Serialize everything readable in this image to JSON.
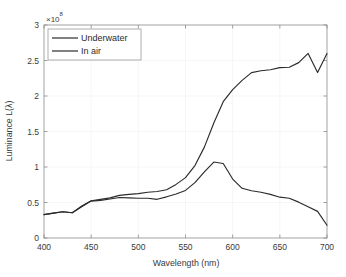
{
  "chart_data": {
    "type": "line",
    "title": "",
    "xlabel": "Wavelength (nm)",
    "ylabel": "Luminance L(λ)",
    "y_exponent_base": "×10",
    "y_exponent_power": "8",
    "y_exponent_label": "×10⁸",
    "xlim": [
      400,
      700
    ],
    "ylim": [
      0,
      3
    ],
    "xticks": [
      400,
      450,
      500,
      550,
      600,
      650,
      700
    ],
    "xtick_labels": [
      "400",
      "450",
      "500",
      "550",
      "600",
      "650",
      "700"
    ],
    "yticks": [
      0,
      0.5,
      1,
      1.5,
      2,
      2.5,
      3
    ],
    "ytick_labels": [
      "0",
      "0.5",
      "1",
      "1.5",
      "2",
      "2.5",
      "3"
    ],
    "grid": true,
    "legend_position": "upper left",
    "x": [
      400,
      410,
      420,
      430,
      440,
      450,
      460,
      470,
      480,
      490,
      500,
      510,
      520,
      530,
      540,
      550,
      560,
      570,
      580,
      590,
      600,
      610,
      620,
      630,
      640,
      650,
      660,
      670,
      680,
      690,
      700
    ],
    "series": [
      {
        "name": "Underwater",
        "values": [
          0.33,
          0.35,
          0.37,
          0.355,
          0.44,
          0.52,
          0.53,
          0.55,
          0.57,
          0.565,
          0.56,
          0.56,
          0.545,
          0.58,
          0.62,
          0.67,
          0.78,
          0.93,
          1.07,
          1.05,
          0.83,
          0.7,
          0.665,
          0.645,
          0.615,
          0.575,
          0.56,
          0.505,
          0.44,
          0.375,
          0.18
        ]
      },
      {
        "name": "In air",
        "values": [
          0.33,
          0.35,
          0.37,
          0.355,
          0.45,
          0.525,
          0.545,
          0.565,
          0.6,
          0.615,
          0.625,
          0.645,
          0.655,
          0.68,
          0.755,
          0.85,
          1.02,
          1.28,
          1.62,
          1.92,
          2.09,
          2.22,
          2.33,
          2.355,
          2.37,
          2.4,
          2.405,
          2.47,
          2.6,
          2.33,
          2.6
        ]
      }
    ],
    "legend_entries": [
      "Underwater",
      "In air"
    ]
  },
  "colors": {
    "series_stroke": "#2b2b2b",
    "axis": "#8c8c8c",
    "grid": "#f2f2f2",
    "background": "#ffffff"
  }
}
